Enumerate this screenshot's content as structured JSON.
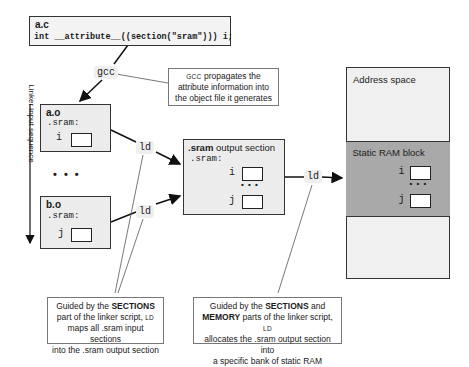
{
  "source_file": {
    "name": "a.c",
    "code": "int __attribute__((section(\"sram\"))) i;"
  },
  "compiler_tag": "gcc",
  "compiler_note": {
    "prefix": "GCC",
    "text": "propagates the attribute information into the object file it generates"
  },
  "linker_axis_label": "Linker input sequence",
  "object_files": [
    {
      "name": "a.o",
      "section": ".sram:",
      "var": "i"
    },
    {
      "name": "b.o",
      "section": ".sram:",
      "var": "j"
    }
  ],
  "ellipsis": "• • •",
  "linker_tag": "ld",
  "output_section": {
    "title_bold": ".sram",
    "title_rest": " output section",
    "section": ".sram:",
    "vars": [
      "i",
      "j"
    ],
    "ellipsis": "• • •"
  },
  "memory": {
    "address_space_label": "Address space",
    "sram_block_label": "Static RAM block",
    "vars": [
      "i",
      "j"
    ],
    "ellipsis": "• • •"
  },
  "note_sections": {
    "line1_pre": "Guided by the ",
    "line1_bold": "SECTIONS",
    "line2_pre": "part of the linker script, ",
    "line2_sc": "LD",
    "line3": "maps all .sram input sections",
    "line4": "into the .sram output section"
  },
  "note_memory": {
    "line1_pre": "Guided by the ",
    "line1_bold": "SECTIONS",
    "line1_post": " and",
    "line2_bold": "MEMORY",
    "line2_post": " parts of the linker script, ",
    "line2_sc": "LD",
    "line3": "allocates the .sram output section into",
    "line4": "a specific bank of static RAM"
  },
  "colors": {
    "box_fill": "#ececec",
    "sram_fill": "#a9a9a9",
    "address_fill": "#f0f0f0",
    "border": "#333333"
  }
}
